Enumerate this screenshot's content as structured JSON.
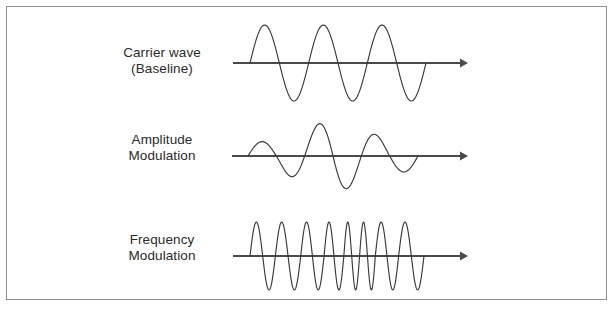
{
  "figure": {
    "background_color": "#ffffff",
    "frame_color": "#8e8e8e",
    "axis_color": "#4a4a4a",
    "wave_color": "#3a3a3a",
    "text_color": "#2b2b2b"
  },
  "rows": [
    {
      "id": "carrier",
      "label_line1": "Carrier wave",
      "label_line2": "(Baseline)",
      "axis_name": "time-axis",
      "arrow_name": "axis-arrow-right"
    },
    {
      "id": "amplitude",
      "label_line1": "Amplitude",
      "label_line2": "Modulation",
      "axis_name": "time-axis",
      "arrow_name": "axis-arrow-right"
    },
    {
      "id": "frequency",
      "label_line1": "Frequency",
      "label_line2": "Modulation",
      "axis_name": "time-axis",
      "arrow_name": "axis-arrow-right"
    }
  ],
  "chart_data": {
    "type": "line",
    "xlabel": "",
    "ylabel": "",
    "grid": false,
    "legend": "none",
    "xlim": [
      0,
      1
    ],
    "ylim": [
      -1.15,
      1.15
    ],
    "series": [
      {
        "name": "Carrier wave (Baseline)",
        "waveform": "sine",
        "cycles": 3,
        "amplitude": 1.0,
        "amplitude_envelope": "constant",
        "frequency_profile": "constant",
        "x_start_px": 250,
        "x_end_px": 426,
        "baseline_y_px": 63,
        "peak_y_px": 25,
        "trough_y_px": 100
      },
      {
        "name": "Amplitude Modulation",
        "waveform": "sine",
        "cycles": 3,
        "amplitude": 1.0,
        "amplitude_envelope": "varying",
        "envelope_values": [
          0.38,
          1.0,
          0.42
        ],
        "frequency_profile": "constant",
        "x_start_px": 248,
        "x_end_px": 418,
        "baseline_y_px": 156,
        "peak_y_px": 118,
        "trough_y_px": 194
      },
      {
        "name": "Frequency Modulation",
        "waveform": "sine",
        "cycles": 8,
        "amplitude": 1.0,
        "amplitude_envelope": "constant",
        "frequency_profile": "varying",
        "cycle_widths_rel": [
          1.0,
          1.0,
          0.92,
          0.78,
          0.62,
          0.62,
          0.92,
          1.0
        ],
        "x_start_px": 250,
        "x_end_px": 424,
        "baseline_y_px": 256,
        "peak_y_px": 222,
        "trough_y_px": 290
      }
    ]
  }
}
